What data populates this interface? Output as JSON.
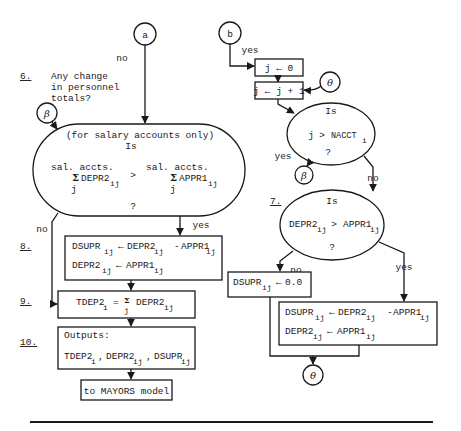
{
  "connectors": {
    "a": "a",
    "b": "b",
    "beta": "β",
    "theta": "θ"
  },
  "labels": {
    "no": "no",
    "yes": "yes",
    "is": "Is",
    "question": "?",
    "gt": ">"
  },
  "steps": {
    "s6": {
      "number": "6.",
      "question_lines": [
        "Any change",
        "in personnel",
        "totals?"
      ]
    },
    "s7": {
      "number": "7."
    },
    "s8": {
      "number": "8."
    },
    "s9": {
      "number": "9."
    },
    "s10": {
      "number": "10."
    }
  },
  "decision_salary": {
    "qualifier": "(for salary accounts only)",
    "left_top": "sal. accts.",
    "left_sigma": "Σ",
    "left_var": "DEPR2",
    "left_sub": "ij",
    "left_index": "j",
    "right_top": "sal. accts.",
    "right_sigma": "Σ",
    "right_var": "APPR1",
    "right_sub": "ij",
    "right_index": "j"
  },
  "box8": {
    "line1": {
      "lhs": "DSUPR",
      "lhs_sub": "ij",
      "arrow": "←",
      "a": "DEPR2",
      "a_sub": "ij",
      "op": "-",
      "b": "APPR1",
      "b_sub": "ij"
    },
    "line2": {
      "lhs": "DEPR2",
      "lhs_sub": "ij",
      "arrow": "←",
      "a": "APPR1",
      "a_sub": "ij"
    }
  },
  "box9": {
    "lhs": "TDEP2",
    "lhs_sub": "i",
    "eq": "=",
    "sigma": "Σ",
    "sigma_index": "j",
    "var": "DEPR2",
    "var_sub": "ij"
  },
  "box10": {
    "title": "Outputs:",
    "items": [
      {
        "name": "TDEP2",
        "sub": "i"
      },
      {
        "name": "DEPR2",
        "sub": "ij"
      },
      {
        "name": "DSUPR",
        "sub": "ij"
      }
    ],
    "sep": ","
  },
  "terminal": {
    "label": "to MAYORS model"
  },
  "loop_init": {
    "text": "j ← 0"
  },
  "loop_incr": {
    "text": "j ← j + 1"
  },
  "decision_j": {
    "lhs": "j",
    "op": ">",
    "rhs": "NACCT",
    "rhs_sub": "i"
  },
  "decision_depr": {
    "lhs": "DEPR2",
    "lhs_sub": "ij",
    "op": ">",
    "rhs": "APPR1",
    "rhs_sub": "ij"
  },
  "box_zero": {
    "lhs": "DSUPR",
    "lhs_sub": "ij",
    "arrow": "←",
    "value": "0.0"
  },
  "box_right": {
    "line1": {
      "lhs": "DSUPR",
      "lhs_sub": "ij",
      "arrow": "←",
      "a": "DEPR2",
      "a_sub": "ij",
      "op": "-",
      "b": "APPR1",
      "b_sub": "ij"
    },
    "line2": {
      "lhs": "DEPR2",
      "lhs_sub": "ij",
      "arrow": "←",
      "a": "APPR1",
      "a_sub": "ij"
    }
  }
}
